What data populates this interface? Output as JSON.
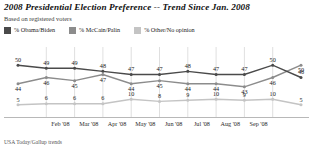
{
  "header": {
    "title": "2008 Presidential Election Preference -- Trend Since Jan. 2008",
    "subtitle": "Based on registered voters"
  },
  "legend": {
    "items": [
      {
        "label": "% Obama/Biden",
        "color": "#4a4a4a"
      },
      {
        "label": "% McCain/Palin",
        "color": "#8c8c8c"
      },
      {
        "label": "% Other/No opinion",
        "color": "#c4c4c4"
      }
    ]
  },
  "footer": {
    "source": "USA Today/Gallup trends"
  },
  "chart_data": {
    "type": "line",
    "title": "2008 Presidential Election Preference -- Trend Since Jan. 2008",
    "subtitle": "Based on registered voters",
    "xlabel": "",
    "ylabel": "",
    "ylim": [
      0,
      55
    ],
    "grid": true,
    "legend_position": "top-left",
    "x": [
      "Jan '08",
      "Feb '08",
      "Mar '08",
      "Mar '08b",
      "Apr '08",
      "May '08",
      "Jun '08",
      "Jul '08",
      "Aug '08",
      "Sep '08",
      "Sep '08b"
    ],
    "tick_labels": [
      "Feb '08",
      "Mar '08",
      "Apr '08",
      "May '08",
      "Jun '08",
      "Jul '08",
      "Aug '08",
      "Sep '08"
    ],
    "series": [
      {
        "name": "% Obama/Biden",
        "color": "#4a4a4a",
        "values": [
          50,
          49,
          49,
          48,
          47,
          47,
          48,
          47,
          47,
          50,
          46
        ]
      },
      {
        "name": "% McCain/Palin",
        "color": "#8c8c8c",
        "values": [
          44,
          46,
          45,
          47,
          44,
          45,
          44,
          44,
          43,
          46,
          50
        ]
      },
      {
        "name": "% Other/No opinion",
        "color": "#c4c4c4",
        "values": [
          5,
          6,
          6,
          6,
          10,
          8,
          9,
          10,
          9,
          10,
          5
        ]
      }
    ]
  }
}
